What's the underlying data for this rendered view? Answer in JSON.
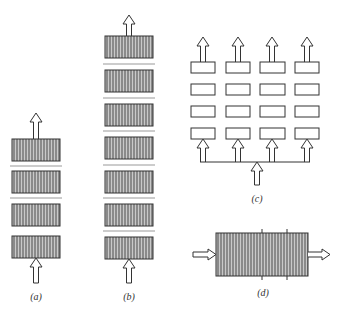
{
  "figure": {
    "panels": [
      {
        "id": "a",
        "label": "(a)",
        "description": "Four stacked hatched modules in series, flow enters bottom, exits top"
      },
      {
        "id": "b",
        "label": "(b)",
        "description": "Six stacked hatched modules in series, flow enters bottom, exits top"
      },
      {
        "id": "c",
        "label": "(c)",
        "description": "4x4 grid of open modules, parallel columns fed by a bottom manifold"
      },
      {
        "id": "d",
        "label": "(d)",
        "description": "Single large hatched module with horizontal flow in and out"
      }
    ],
    "colors": {
      "hatch_dark": "#8a8a8a",
      "hatch_light": "#c9c9c9",
      "outline": "#333333",
      "separator": "#999999",
      "background": "#ffffff"
    }
  }
}
